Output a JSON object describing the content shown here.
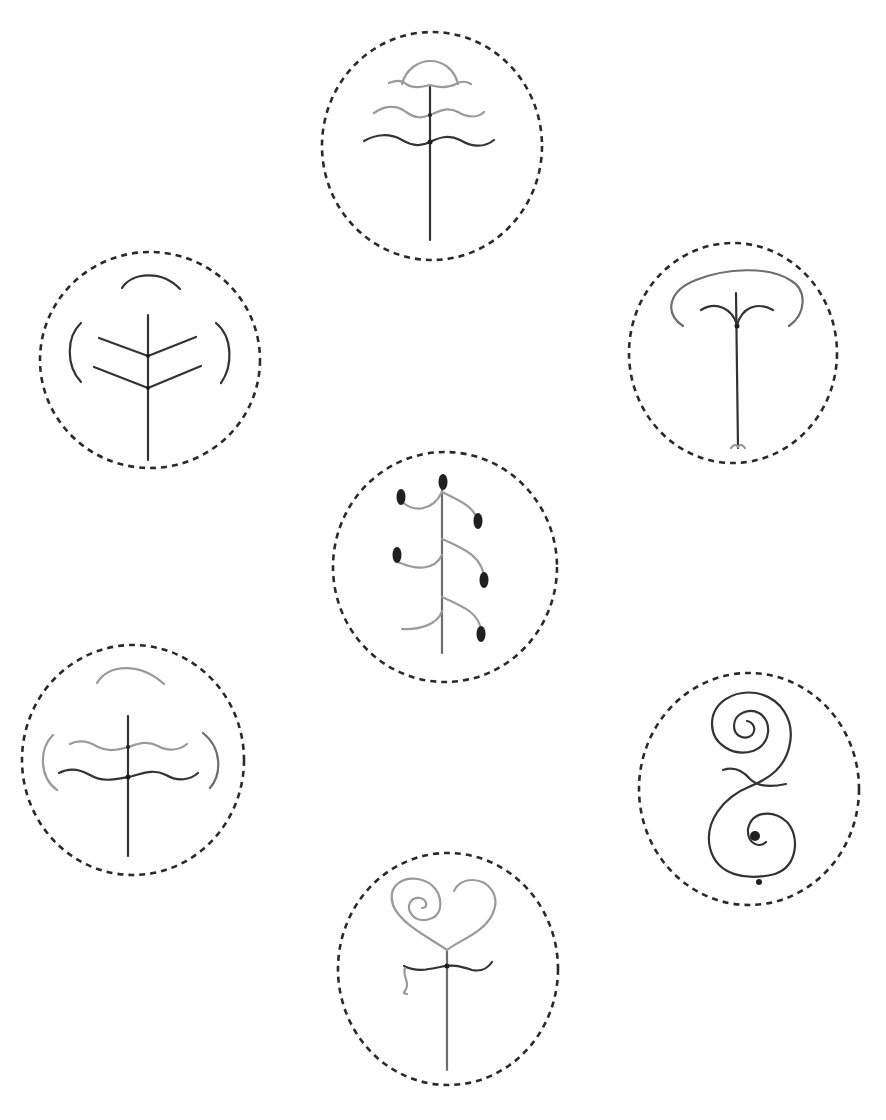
{
  "figure": {
    "description": "Seven symbolic tree/plant glyphs, each enclosed in a dashed circle",
    "colors": {
      "background": "#ffffff",
      "dashed_ring": "#2a2a2a",
      "dark_stroke": "#333333",
      "mid_stroke": "#6e6e6e",
      "light_stroke": "#9a9a9a",
      "fill": "#1f1f1f"
    },
    "glyphs": [
      {
        "id": "top-center",
        "name": "tree with three wavy tiers and arch",
        "position": "top center"
      },
      {
        "id": "upper-left",
        "name": "tree with chevron branches and three arcs",
        "position": "upper left"
      },
      {
        "id": "upper-right",
        "name": "tree with curled fork and wide canopy arc",
        "position": "upper right"
      },
      {
        "id": "center",
        "name": "stem with alternating curved branches ending in seeds",
        "position": "center"
      },
      {
        "id": "lower-left",
        "name": "tree with two wavy tiers and three arcs",
        "position": "lower left"
      },
      {
        "id": "lower-right",
        "name": "double spiral S-shape with dot",
        "position": "lower right"
      },
      {
        "id": "bottom-center",
        "name": "heart-shaped spiral on stem with wavy bar",
        "position": "bottom center"
      }
    ]
  }
}
